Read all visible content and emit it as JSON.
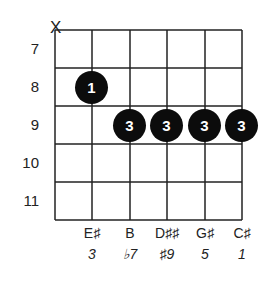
{
  "chord_diagram": {
    "fret_numbers": [
      "7",
      "8",
      "9",
      "10",
      "11"
    ],
    "muted_string_marker": "X",
    "muted_string": 1,
    "fingers": [
      {
        "string": 2,
        "fret": "8",
        "finger": "1"
      },
      {
        "string": 3,
        "fret": "9",
        "finger": "3"
      },
      {
        "string": 4,
        "fret": "9",
        "finger": "3"
      },
      {
        "string": 5,
        "fret": "9",
        "finger": "3"
      },
      {
        "string": 6,
        "fret": "9",
        "finger": "3"
      }
    ],
    "notes": [
      "E♯",
      "B",
      "D♯♯",
      "G♯",
      "C♯"
    ],
    "intervals": [
      "3",
      "♭7",
      "♯9",
      "5",
      "1"
    ],
    "colors": {
      "dot": "#0c0c0c",
      "line": "#222222",
      "dot_text": "#ffffff"
    }
  }
}
